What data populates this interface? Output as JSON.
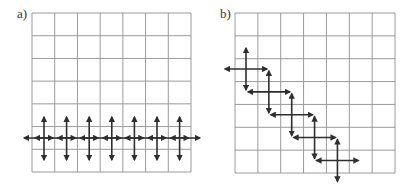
{
  "panels": [
    {
      "label": "a)",
      "cols": 7,
      "rows": 7,
      "arrangement": "row",
      "crosses": 7,
      "description": "Seven double-headed crosses aligned along a single horizontal row, joined by a continuous horizontal axis"
    },
    {
      "label": "b)",
      "cols": 7,
      "rows": 7,
      "arrangement": "diagonal",
      "crosses": 5,
      "description": "Five double-headed crosses stepping diagonally down-right"
    }
  ],
  "colors": {
    "grid": "#9a9a9a",
    "arrow": "#2e2e2e",
    "text": "#333333"
  }
}
